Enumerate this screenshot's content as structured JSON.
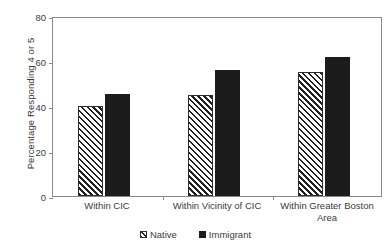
{
  "chart_data": {
    "type": "bar",
    "title": "",
    "subtitle": "",
    "xlabel": "",
    "ylabel": "Percentage Responding 4 or 5",
    "categories": [
      "Within CIC",
      "Within Vicinity of CIC",
      "Within Greater Boston Area"
    ],
    "series": [
      {
        "name": "Native",
        "values": [
          40,
          45,
          55
        ],
        "fill": "diagonal-hatch",
        "color": "#222222"
      },
      {
        "name": "Immigrant",
        "values": [
          45.5,
          56,
          62
        ],
        "fill": "solid",
        "color": "#1c1c1c"
      }
    ],
    "ylim": [
      0,
      80
    ],
    "yticks": [
      0,
      20,
      40,
      60,
      80
    ],
    "ytick_labels": [
      "0",
      "20",
      "40",
      "60",
      "80"
    ],
    "grid": false,
    "legend_position": "bottom-center",
    "frame": "box"
  },
  "axes": {
    "y_title": "Percentage Responding 4 or 5"
  },
  "legend": {
    "items": [
      {
        "label": "Native",
        "swatch": "hatched-square"
      },
      {
        "label": "Immigrant",
        "swatch": "solid-black-square"
      }
    ]
  }
}
